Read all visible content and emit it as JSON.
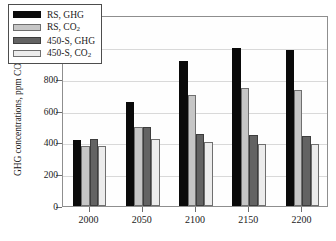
{
  "chart_data": {
    "type": "bar",
    "title": "",
    "xlabel": "",
    "ylabel": "GHG concentrations, ppm CO2 (equiv.)",
    "categories": [
      "2000",
      "2050",
      "2100",
      "2150",
      "2200"
    ],
    "ylim": [
      0,
      1200
    ],
    "yticks": [
      0,
      200,
      400,
      600,
      800,
      1000,
      1200
    ],
    "ytick_labels": [
      "0",
      "200",
      "400",
      "600",
      "800",
      "1000",
      "1200"
    ],
    "grid": true,
    "legend_position": "upper left",
    "series": [
      {
        "name": "RS, GHG",
        "color": "#0a0a0a",
        "values": [
          415,
          655,
          910,
          990,
          978
        ]
      },
      {
        "name": "RS, CO2",
        "color": "#c6c6c6",
        "values": [
          378,
          495,
          695,
          742,
          730
        ]
      },
      {
        "name": "450-S, GHG",
        "color": "#636363",
        "values": [
          418,
          495,
          455,
          445,
          442
        ]
      },
      {
        "name": "450-S, CO2",
        "color": "#ececec",
        "values": [
          378,
          422,
          405,
          392,
          390
        ]
      }
    ]
  },
  "axis": {
    "y_title_main": "GHG concentrations, ppm CO",
    "y_title_sub": "2",
    "y_title_tail": " (equiv.)"
  },
  "legend": {
    "entries": [
      {
        "label_main": "RS, GHG",
        "label_sub": "",
        "label_tail": ""
      },
      {
        "label_main": "RS, CO",
        "label_sub": "2",
        "label_tail": ""
      },
      {
        "label_main": "450-S, GHG",
        "label_sub": "",
        "label_tail": ""
      },
      {
        "label_main": "450-S, CO",
        "label_sub": "2",
        "label_tail": ""
      }
    ]
  }
}
